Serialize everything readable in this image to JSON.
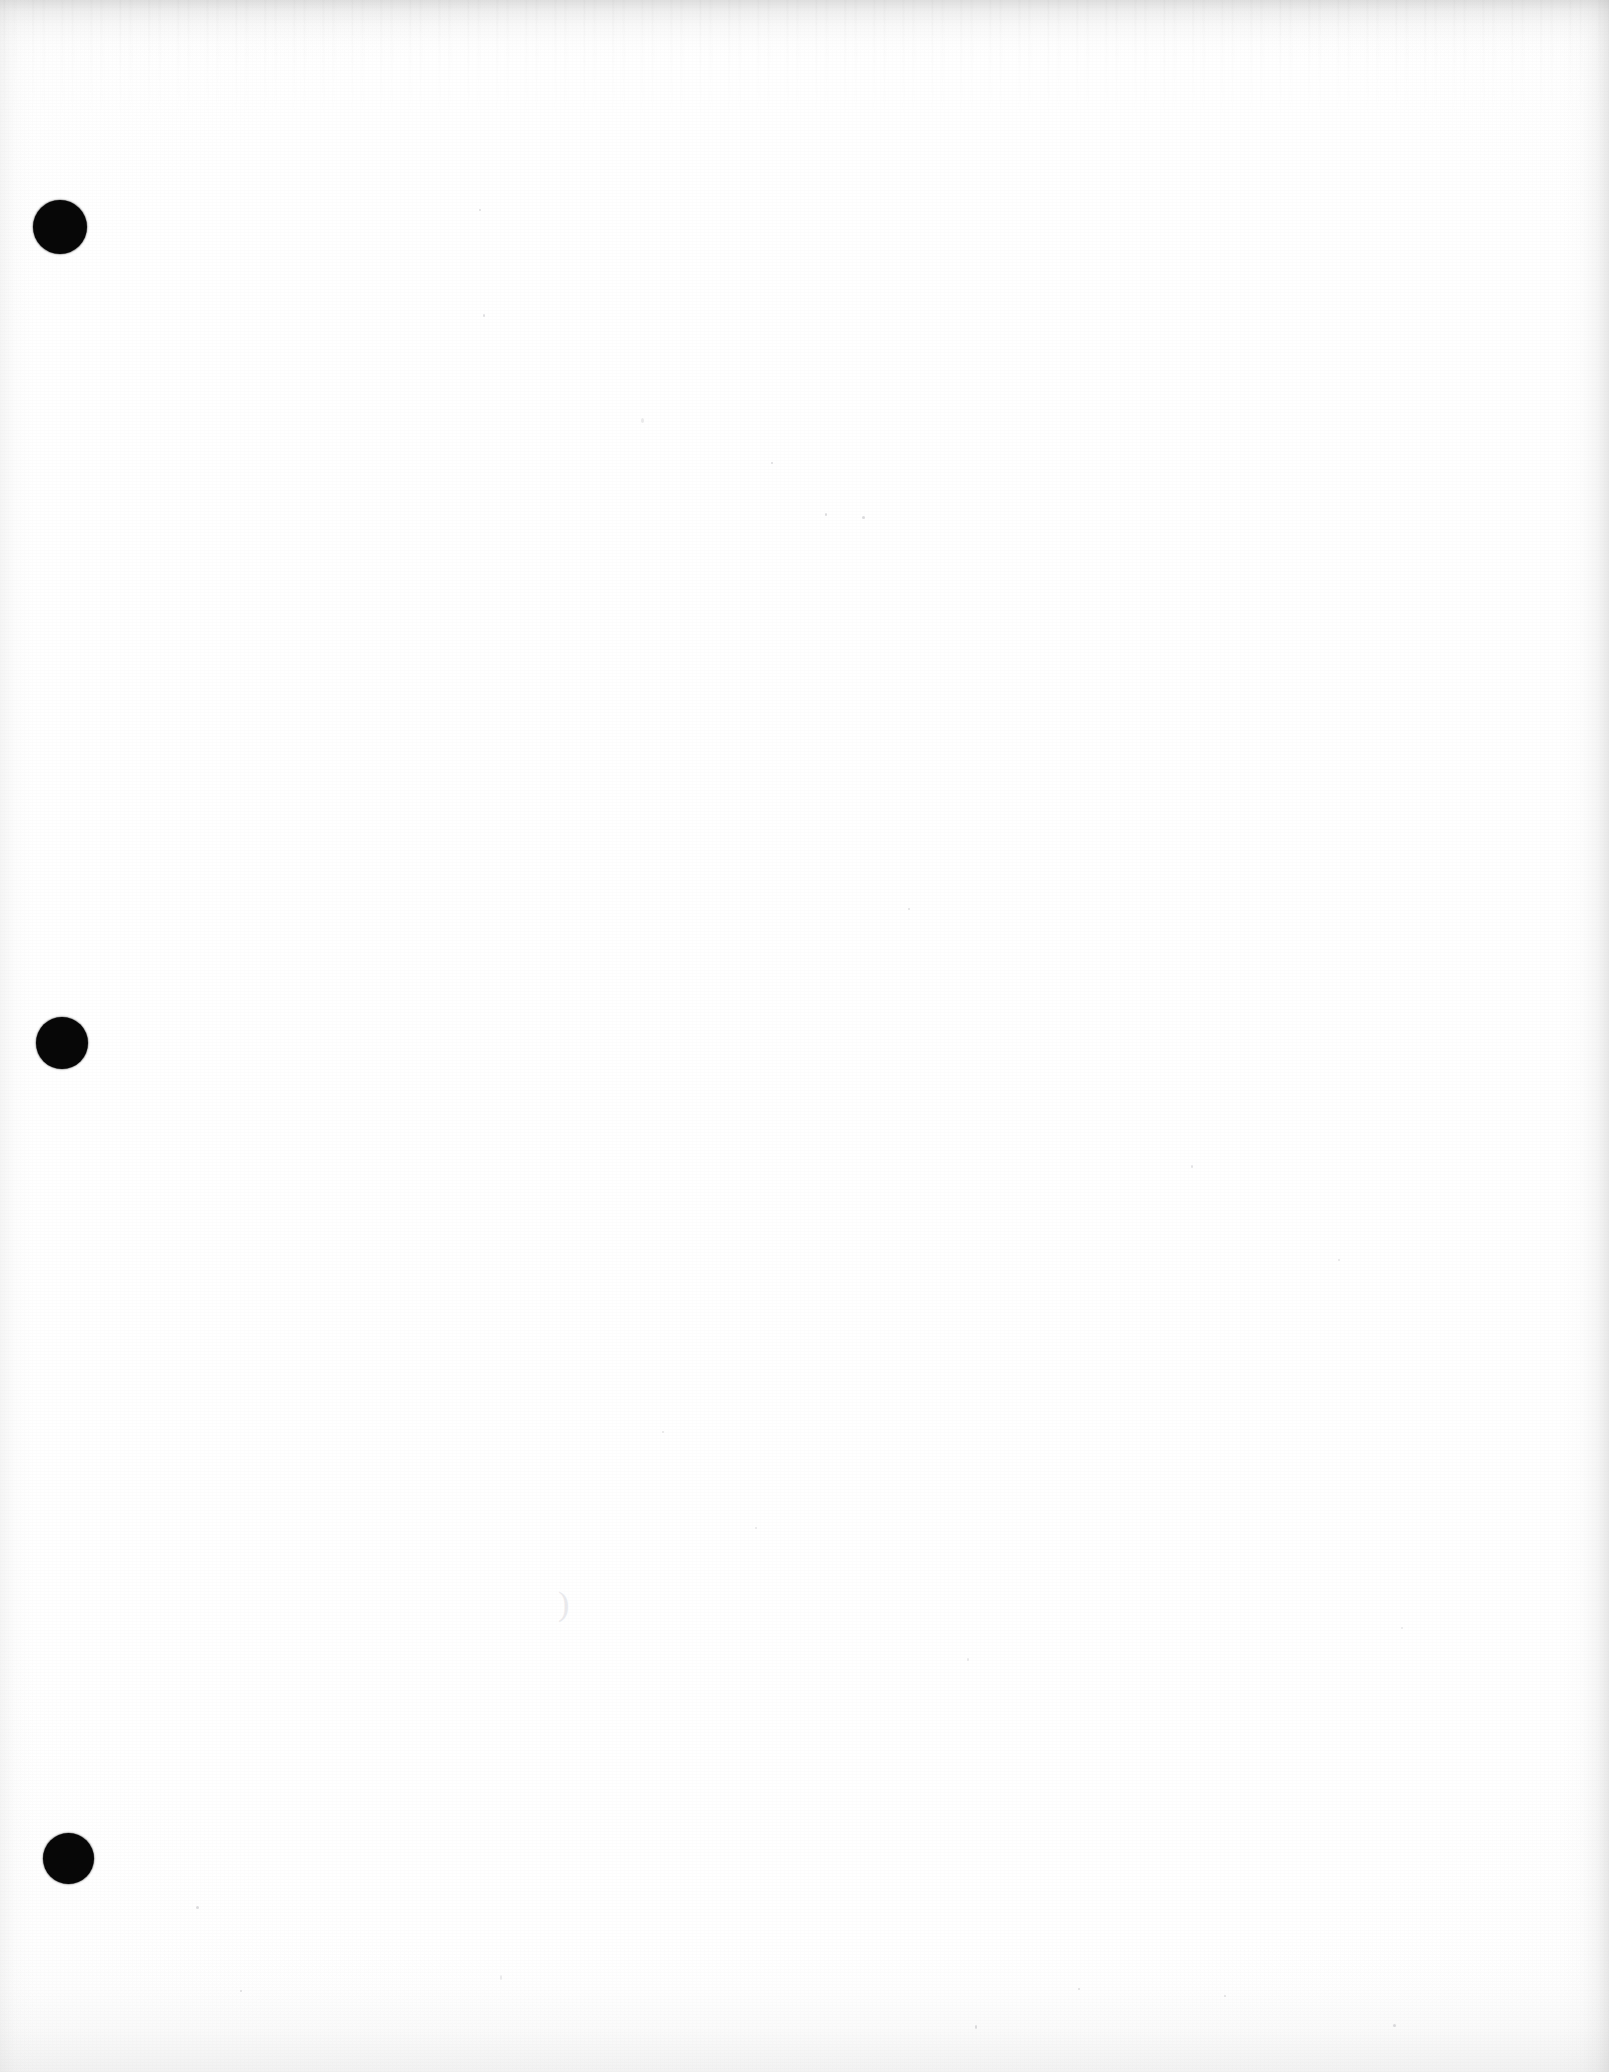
{
  "document": {
    "kind": "scanned-page",
    "title": "Scanned blank page",
    "page_width": 1609,
    "page_height": 2072,
    "content_text": "",
    "background_color": "#ffffff",
    "paper_tone": "#fdfdfd",
    "ink_color": "#070707",
    "edge_artifact_color": "#c8c8c8"
  },
  "punch_holes": {
    "label": "three-hole punch marks",
    "count": 3,
    "color": "#070707",
    "items": [
      {
        "name": "punch-hole-top",
        "cx": 60,
        "cy": 227,
        "d": 54
      },
      {
        "name": "punch-hole-middle",
        "cx": 62,
        "cy": 1043,
        "d": 52
      },
      {
        "name": "punch-hole-bottom",
        "cx": 68,
        "cy": 1858,
        "d": 51
      }
    ]
  },
  "scan_artifacts": {
    "top_band": {
      "name": "top-edge-scan-band",
      "height": 60,
      "color": "#c8c8c8"
    },
    "right_band": {
      "name": "right-edge-scan-band",
      "width": 46,
      "color": "#cfcfcf"
    },
    "bottom_band": {
      "name": "bottom-edge-scan-band",
      "height": 130,
      "color": "#dcdcdc"
    },
    "left_band": {
      "name": "left-edge-scan-band",
      "width": 34,
      "color": "#e0e0e0"
    },
    "specks": [
      {
        "x": 641,
        "y": 418,
        "w": 3,
        "h": 5
      },
      {
        "x": 825,
        "y": 513,
        "w": 2,
        "h": 3
      },
      {
        "x": 862,
        "y": 516,
        "w": 3,
        "h": 3
      },
      {
        "x": 771,
        "y": 462,
        "w": 2,
        "h": 2
      },
      {
        "x": 479,
        "y": 209,
        "w": 2,
        "h": 2
      },
      {
        "x": 483,
        "y": 314,
        "w": 2,
        "h": 3
      },
      {
        "x": 908,
        "y": 908,
        "w": 2,
        "h": 2
      },
      {
        "x": 1191,
        "y": 1165,
        "w": 2,
        "h": 3
      },
      {
        "x": 1338,
        "y": 1259,
        "w": 2,
        "h": 2
      },
      {
        "x": 662,
        "y": 1431,
        "w": 2,
        "h": 2
      },
      {
        "x": 755,
        "y": 1527,
        "w": 2,
        "h": 2
      },
      {
        "x": 967,
        "y": 1658,
        "w": 2,
        "h": 3
      },
      {
        "x": 1401,
        "y": 1627,
        "w": 2,
        "h": 2
      },
      {
        "x": 500,
        "y": 1975,
        "w": 2,
        "h": 5
      },
      {
        "x": 975,
        "y": 2025,
        "w": 2,
        "h": 4
      },
      {
        "x": 1393,
        "y": 2024,
        "w": 3,
        "h": 3
      },
      {
        "x": 196,
        "y": 1906,
        "w": 3,
        "h": 3
      },
      {
        "x": 1078,
        "y": 1988,
        "w": 2,
        "h": 2
      },
      {
        "x": 240,
        "y": 1990,
        "w": 2,
        "h": 2
      },
      {
        "x": 1224,
        "y": 1995,
        "w": 2,
        "h": 2
      }
    ],
    "pencil_mark": {
      "name": "faint-pencil-squiggle",
      "x": 558,
      "y": 1587,
      "glyph": ")"
    }
  }
}
